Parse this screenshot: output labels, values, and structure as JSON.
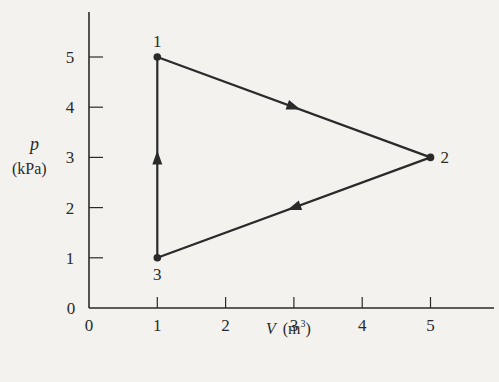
{
  "chart_data": {
    "type": "line",
    "title": "",
    "xlabel": "V (m³)",
    "xlabel_var": "V",
    "xlabel_unit": "(m",
    "xlabel_unit_sup": "3",
    "xlabel_unit_close": ")",
    "ylabel_var": "p",
    "ylabel_unit": "(kPa)",
    "xlim": [
      0,
      5
    ],
    "ylim": [
      0,
      5
    ],
    "x_ticks": [
      0,
      1,
      2,
      3,
      4,
      5
    ],
    "y_ticks": [
      0,
      1,
      2,
      3,
      4,
      5
    ],
    "x_tick_labels": [
      "0",
      "1",
      "2",
      "3",
      "4",
      "5"
    ],
    "y_tick_labels": [
      "0",
      "1",
      "2",
      "3",
      "4",
      "5"
    ],
    "grid": false,
    "points": [
      {
        "label": "1",
        "V": 1,
        "p": 5
      },
      {
        "label": "2",
        "V": 5,
        "p": 3
      },
      {
        "label": "3",
        "V": 1,
        "p": 1
      }
    ],
    "processes": [
      {
        "from": "1",
        "to": "2"
      },
      {
        "from": "2",
        "to": "3"
      },
      {
        "from": "3",
        "to": "1"
      }
    ]
  },
  "colors": {
    "ink": "#2a2a2a",
    "paper": "#f3f2ef"
  }
}
